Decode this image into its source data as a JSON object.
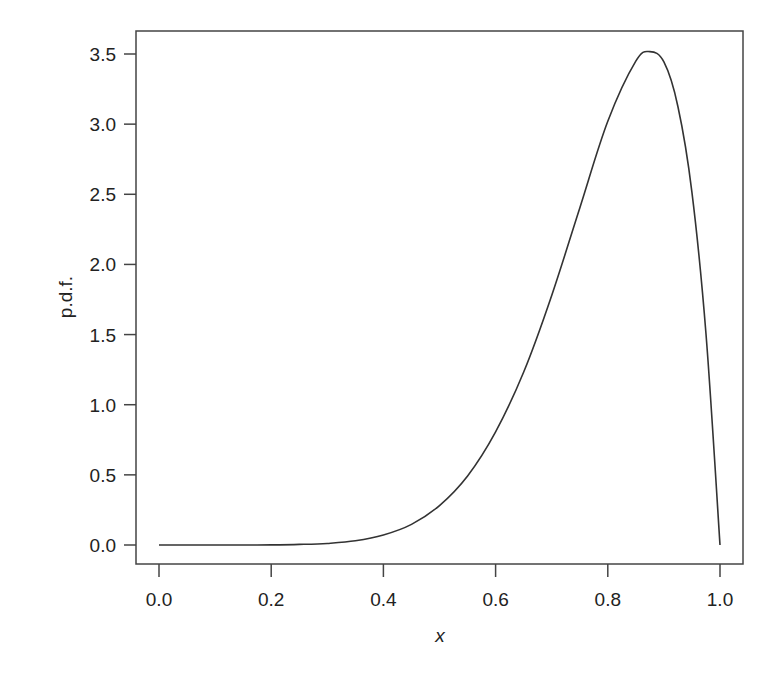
{
  "chart_data": {
    "type": "line",
    "title": "",
    "xlabel": "x",
    "ylabel": "p.d.f.",
    "xlim": [
      0.0,
      1.0
    ],
    "ylim": [
      0.0,
      3.5
    ],
    "x_ticks": [
      "0.0",
      "0.2",
      "0.4",
      "0.6",
      "0.8",
      "1.0"
    ],
    "y_ticks": [
      "0.0",
      "0.5",
      "1.0",
      "1.5",
      "2.0",
      "2.5",
      "3.0",
      "3.5"
    ],
    "grid": false,
    "legend": null,
    "series": [
      {
        "name": "p.d.f.",
        "color": "#333333",
        "x": [
          0.0,
          0.05,
          0.1,
          0.15,
          0.2,
          0.25,
          0.3,
          0.35,
          0.4,
          0.45,
          0.5,
          0.55,
          0.6,
          0.65,
          0.7,
          0.75,
          0.8,
          0.85,
          0.875,
          0.9,
          0.925,
          0.95,
          0.975,
          1.0
        ],
        "y": [
          0.0,
          0.0,
          0.0,
          0.0,
          0.001,
          0.004,
          0.011,
          0.03,
          0.071,
          0.147,
          0.281,
          0.492,
          0.806,
          1.233,
          1.779,
          2.403,
          3.02,
          3.449,
          3.517,
          3.444,
          3.126,
          2.515,
          1.504,
          0.0
        ]
      }
    ],
    "annotations": []
  },
  "axes": {
    "x_title": "x",
    "y_title": "p.d.f."
  }
}
